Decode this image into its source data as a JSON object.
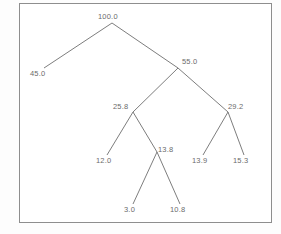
{
  "diagram": {
    "type": "hierarchical-tree",
    "title": "",
    "frame": {
      "border_color": "#8e8e8e",
      "background_color": "#ffffff"
    },
    "style": {
      "edge_color": "#6e6e6e",
      "label_color": "#6b6b6b"
    },
    "nodes": [
      {
        "id": "n100",
        "label": "100.0",
        "value": 100.0,
        "x": 112,
        "y": 23,
        "label_x": 98,
        "label_y": 13,
        "is_leaf": false
      },
      {
        "id": "n45",
        "label": "45.0",
        "value": 45.0,
        "x": 44,
        "y": 68,
        "label_x": 30,
        "label_y": 70,
        "is_leaf": true
      },
      {
        "id": "n55",
        "label": "55.0",
        "value": 55.0,
        "x": 178,
        "y": 68,
        "label_x": 182,
        "label_y": 58,
        "is_leaf": false
      },
      {
        "id": "n258",
        "label": "25.8",
        "value": 25.8,
        "x": 133,
        "y": 112,
        "label_x": 113,
        "label_y": 103,
        "is_leaf": false
      },
      {
        "id": "n292",
        "label": "29.2",
        "value": 29.2,
        "x": 228,
        "y": 112,
        "label_x": 228,
        "label_y": 103,
        "is_leaf": false
      },
      {
        "id": "n12",
        "label": "12.0",
        "value": 12.0,
        "x": 107,
        "y": 155,
        "label_x": 96,
        "label_y": 157,
        "is_leaf": true
      },
      {
        "id": "n138",
        "label": "13.8",
        "value": 13.8,
        "x": 157,
        "y": 152,
        "label_x": 158,
        "label_y": 146,
        "is_leaf": false
      },
      {
        "id": "n139",
        "label": "13.9",
        "value": 13.9,
        "x": 203,
        "y": 155,
        "label_x": 192,
        "label_y": 157,
        "is_leaf": true
      },
      {
        "id": "n153",
        "label": "15.3",
        "value": 15.3,
        "x": 244,
        "y": 155,
        "label_x": 233,
        "label_y": 157,
        "is_leaf": true
      },
      {
        "id": "n3",
        "label": "3.0",
        "value": 3.0,
        "x": 133,
        "y": 204,
        "label_x": 124,
        "label_y": 206,
        "is_leaf": true
      },
      {
        "id": "n108",
        "label": "10.8",
        "value": 10.8,
        "x": 180,
        "y": 204,
        "label_x": 170,
        "label_y": 206,
        "is_leaf": true
      }
    ],
    "edges": [
      {
        "from": "n100",
        "to": "n45"
      },
      {
        "from": "n100",
        "to": "n55"
      },
      {
        "from": "n55",
        "to": "n258"
      },
      {
        "from": "n55",
        "to": "n292"
      },
      {
        "from": "n258",
        "to": "n12"
      },
      {
        "from": "n258",
        "to": "n138"
      },
      {
        "from": "n292",
        "to": "n139"
      },
      {
        "from": "n292",
        "to": "n153"
      },
      {
        "from": "n138",
        "to": "n3"
      },
      {
        "from": "n138",
        "to": "n108"
      }
    ]
  }
}
